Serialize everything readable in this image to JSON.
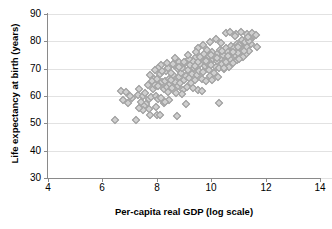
{
  "chart_data": {
    "type": "scatter",
    "title": "",
    "xlabel": "Per-capita real GDP (log scale)",
    "ylabel": "Life expectancy at birth (years)",
    "xlim": [
      4,
      14
    ],
    "ylim": [
      30,
      90
    ],
    "xticks": [
      4,
      6,
      8,
      10,
      12,
      14
    ],
    "yticks": [
      30,
      40,
      50,
      60,
      70,
      80,
      90
    ],
    "xtick_labels": [
      "4",
      "6",
      "8",
      "10",
      "12",
      "14"
    ],
    "ytick_labels": [
      "30",
      "40",
      "50",
      "60",
      "70",
      "80",
      "90"
    ],
    "grid": "horizontal",
    "legend": "none",
    "marker": "diamond",
    "marker_fill": "#cfcfcf",
    "marker_edge": "#9a9a9a",
    "axis_color": "#8a8a8a",
    "gridline_color": "#e2e2e2",
    "background": "#ffffff",
    "series": [
      {
        "name": "countries",
        "points": [
          [
            6.48,
            51.2
          ],
          [
            7.25,
            51.1
          ],
          [
            7.78,
            52.9
          ],
          [
            8.02,
            53.0
          ],
          [
            8.12,
            52.9
          ],
          [
            8.75,
            52.6
          ],
          [
            9.08,
            56.9
          ],
          [
            10.32,
            57.1
          ],
          [
            8.28,
            57.3
          ],
          [
            7.62,
            57.0
          ],
          [
            7.55,
            56.3
          ],
          [
            7.42,
            57.6
          ],
          [
            6.78,
            58.2
          ],
          [
            6.72,
            61.6
          ],
          [
            6.88,
            61.3
          ],
          [
            7.12,
            59.1
          ],
          [
            7.32,
            60.3
          ],
          [
            7.36,
            62.2
          ],
          [
            7.52,
            59.8
          ],
          [
            7.58,
            61.0
          ],
          [
            7.72,
            58.6
          ],
          [
            7.82,
            59.4
          ],
          [
            7.88,
            62.3
          ],
          [
            7.95,
            64.0
          ],
          [
            7.98,
            60.0
          ],
          [
            8.05,
            63.5
          ],
          [
            8.08,
            58.7
          ],
          [
            8.18,
            59.2
          ],
          [
            8.22,
            64.8
          ],
          [
            8.28,
            62.5
          ],
          [
            8.32,
            65.3
          ],
          [
            8.38,
            63.1
          ],
          [
            8.42,
            61.4
          ],
          [
            8.45,
            66.2
          ],
          [
            8.52,
            64.2
          ],
          [
            8.58,
            62.8
          ],
          [
            8.62,
            67.5
          ],
          [
            8.68,
            65.0
          ],
          [
            8.72,
            60.8
          ],
          [
            8.78,
            63.6
          ],
          [
            8.82,
            66.8
          ],
          [
            8.88,
            64.4
          ],
          [
            8.92,
            68.2
          ],
          [
            8.98,
            62.0
          ],
          [
            9.02,
            65.6
          ],
          [
            9.08,
            67.0
          ],
          [
            9.12,
            63.2
          ],
          [
            9.18,
            69.4
          ],
          [
            9.22,
            66.4
          ],
          [
            9.28,
            64.6
          ],
          [
            9.32,
            68.0
          ],
          [
            9.38,
            70.2
          ],
          [
            9.42,
            65.8
          ],
          [
            9.48,
            67.6
          ],
          [
            9.52,
            62.1
          ],
          [
            9.58,
            69.0
          ],
          [
            9.62,
            71.4
          ],
          [
            9.68,
            66.0
          ],
          [
            9.72,
            68.6
          ],
          [
            9.78,
            70.8
          ],
          [
            9.82,
            65.4
          ],
          [
            9.88,
            72.0
          ],
          [
            9.92,
            69.2
          ],
          [
            9.98,
            67.2
          ],
          [
            10.02,
            71.0
          ],
          [
            10.08,
            73.2
          ],
          [
            10.12,
            68.4
          ],
          [
            10.18,
            70.4
          ],
          [
            10.22,
            72.6
          ],
          [
            10.28,
            66.6
          ],
          [
            10.32,
            70.0
          ],
          [
            10.38,
            73.8
          ],
          [
            10.42,
            71.6
          ],
          [
            10.48,
            69.6
          ],
          [
            10.52,
            74.4
          ],
          [
            10.58,
            72.2
          ],
          [
            10.62,
            75.0
          ],
          [
            10.68,
            70.6
          ],
          [
            10.72,
            73.4
          ],
          [
            10.78,
            76.2
          ],
          [
            10.82,
            71.8
          ],
          [
            10.88,
            74.8
          ],
          [
            10.92,
            77.0
          ],
          [
            10.98,
            73.0
          ],
          [
            11.02,
            75.6
          ],
          [
            11.08,
            78.2
          ],
          [
            11.12,
            74.2
          ],
          [
            11.18,
            76.8
          ],
          [
            11.22,
            79.4
          ],
          [
            11.28,
            75.2
          ],
          [
            11.32,
            77.6
          ],
          [
            11.38,
            80.0
          ],
          [
            11.42,
            76.4
          ],
          [
            11.48,
            78.8
          ],
          [
            11.52,
            81.2
          ],
          [
            7.92,
            66.2
          ],
          [
            8.12,
            67.8
          ],
          [
            8.35,
            69.0
          ],
          [
            8.48,
            70.6
          ],
          [
            8.55,
            68.4
          ],
          [
            8.65,
            71.2
          ],
          [
            8.78,
            69.8
          ],
          [
            8.85,
            72.4
          ],
          [
            8.95,
            70.2
          ],
          [
            9.05,
            71.8
          ],
          [
            9.15,
            73.0
          ],
          [
            9.25,
            71.0
          ],
          [
            9.35,
            72.8
          ],
          [
            9.45,
            74.0
          ],
          [
            9.55,
            72.4
          ],
          [
            9.65,
            73.6
          ],
          [
            9.75,
            75.2
          ],
          [
            9.85,
            73.4
          ],
          [
            9.95,
            74.6
          ],
          [
            10.05,
            76.0
          ],
          [
            10.15,
            74.2
          ],
          [
            10.25,
            75.4
          ],
          [
            10.35,
            76.6
          ],
          [
            10.45,
            75.0
          ],
          [
            10.55,
            77.2
          ],
          [
            10.65,
            76.0
          ],
          [
            10.75,
            78.0
          ],
          [
            10.85,
            77.4
          ],
          [
            10.95,
            79.0
          ],
          [
            11.05,
            78.4
          ],
          [
            11.15,
            80.2
          ],
          [
            11.25,
            79.6
          ],
          [
            11.35,
            81.0
          ],
          [
            11.45,
            80.4
          ],
          [
            11.55,
            82.0
          ],
          [
            7.68,
            63.8
          ],
          [
            7.85,
            65.2
          ],
          [
            8.02,
            66.0
          ],
          [
            8.22,
            68.8
          ],
          [
            8.42,
            70.0
          ],
          [
            8.62,
            71.6
          ],
          [
            8.82,
            70.4
          ],
          [
            9.02,
            72.2
          ],
          [
            9.22,
            73.4
          ],
          [
            9.42,
            70.8
          ],
          [
            9.62,
            74.2
          ],
          [
            9.82,
            72.6
          ],
          [
            10.02,
            74.8
          ],
          [
            10.22,
            73.8
          ],
          [
            10.42,
            76.4
          ],
          [
            10.62,
            74.6
          ],
          [
            10.82,
            75.8
          ],
          [
            11.02,
            77.8
          ],
          [
            11.22,
            76.2
          ],
          [
            11.42,
            79.8
          ],
          [
            10.55,
            83.0
          ],
          [
            10.72,
            83.4
          ],
          [
            10.92,
            82.6
          ],
          [
            11.12,
            83.2
          ],
          [
            11.32,
            82.4
          ],
          [
            11.52,
            82.8
          ],
          [
            11.68,
            82.2
          ],
          [
            11.72,
            77.8
          ],
          [
            11.18,
            74.0
          ],
          [
            11.05,
            73.2
          ],
          [
            10.48,
            70.0
          ],
          [
            10.05,
            65.8
          ],
          [
            9.68,
            61.8
          ],
          [
            9.35,
            62.8
          ],
          [
            8.95,
            60.6
          ],
          [
            8.55,
            65.8
          ],
          [
            8.18,
            71.0
          ],
          [
            8.05,
            70.2
          ],
          [
            7.95,
            69.4
          ],
          [
            7.78,
            67.4
          ],
          [
            8.38,
            72.0
          ],
          [
            8.68,
            73.6
          ],
          [
            8.48,
            58.4
          ],
          [
            8.32,
            57.8
          ],
          [
            7.98,
            55.8
          ],
          [
            7.72,
            55.2
          ],
          [
            7.52,
            54.8
          ],
          [
            7.38,
            55.6
          ],
          [
            6.95,
            57.4
          ],
          [
            7.05,
            59.8
          ],
          [
            10.88,
            81.6
          ],
          [
            11.38,
            81.4
          ],
          [
            9.98,
            79.6
          ],
          [
            9.72,
            78.6
          ],
          [
            9.52,
            77.4
          ],
          [
            10.18,
            80.6
          ],
          [
            10.38,
            79.2
          ],
          [
            9.88,
            76.8
          ],
          [
            9.45,
            75.8
          ],
          [
            9.18,
            75.0
          ]
        ]
      }
    ]
  }
}
